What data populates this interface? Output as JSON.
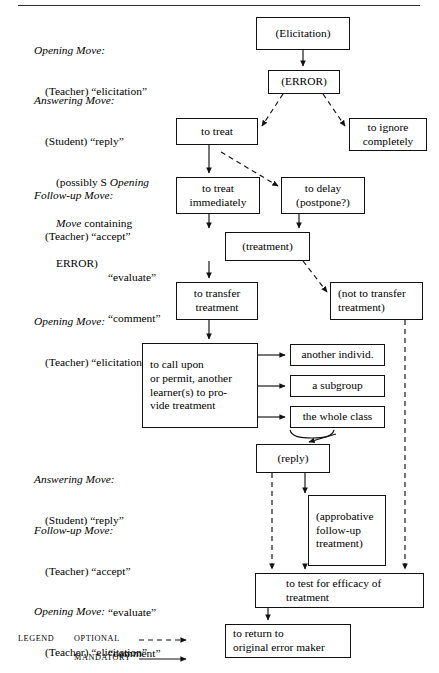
{
  "figure": {
    "title_rule": true,
    "type": "flowchart",
    "colors": {
      "ink": "#111111",
      "paper": "#ffffff",
      "rule": "#2b2b2b"
    }
  },
  "annotations": [
    {
      "id": "ann-opening-1",
      "heading": "Opening Move:",
      "lines": [
        "(Teacher) “elicitation”"
      ]
    },
    {
      "id": "ann-answering-1",
      "heading": "Answering Move:",
      "lines": [
        "(Student) “reply”",
        "(possibly S Opening",
        "Move containing",
        "ERROR)"
      ]
    },
    {
      "id": "ann-followup-1",
      "heading": "Follow-up Move:",
      "lines": [
        "(Teacher) “accept”",
        "“evaluate”",
        "“comment”"
      ]
    },
    {
      "id": "ann-opening-2",
      "heading": "Opening Move:",
      "lines": [
        "(Teacher) “elicitation”"
      ]
    },
    {
      "id": "ann-answering-2",
      "heading": "Answering Move:",
      "lines": [
        "(Student) “reply”"
      ]
    },
    {
      "id": "ann-followup-2",
      "heading": "Follow-up Move:",
      "lines": [
        "(Teacher) “accept”",
        "“evaluate”",
        "“comment”"
      ]
    },
    {
      "id": "ann-opening-3",
      "heading": "Opening Move:",
      "lines": [
        "(Teacher) “elicitation”"
      ]
    }
  ],
  "nodes": {
    "elicitation": {
      "label": "(Elicitation)"
    },
    "error": {
      "label": "(ERROR)"
    },
    "to_treat": {
      "label": "to treat"
    },
    "to_ignore": {
      "line1": "to ignore",
      "line2": "completely"
    },
    "treat_immediately": {
      "line1": "to treat",
      "line2": "immediately"
    },
    "to_delay": {
      "line1": "to delay",
      "line2": "(postpone?)"
    },
    "treatment": {
      "label": "(treatment)"
    },
    "transfer": {
      "line1": "to transfer",
      "line2": "treatment"
    },
    "not_transfer": {
      "line1": "(not to transfer",
      "line2": "treatment)"
    },
    "call_upon": {
      "line1": "to call upon",
      "line2": "or permit, another",
      "line3": "learner(s) to pro-",
      "line4": "vide treatment"
    },
    "another_individ": {
      "label": "another individ."
    },
    "a_subgroup": {
      "label": "a subgroup"
    },
    "whole_class": {
      "label": "the whole class"
    },
    "reply": {
      "label": "(reply)"
    },
    "approbative": {
      "line1": "(approbative",
      "line2": "follow-up",
      "line3": "treatment)"
    },
    "test_efficacy": {
      "line1": "to test for efficacy of",
      "line2": "treatment"
    },
    "return_maker": {
      "line1": "to return to",
      "line2": "original error maker"
    }
  },
  "legend": {
    "title": "LEGEND",
    "items": [
      {
        "label": "OPTIONAL",
        "style": "dashed-arrow"
      },
      {
        "label": "MANDATORY",
        "style": "solid-arrow"
      }
    ]
  },
  "edges": [
    {
      "from": "elicitation",
      "to": "error",
      "style": "mandatory"
    },
    {
      "from": "error",
      "to": "to_treat",
      "style": "optional"
    },
    {
      "from": "error",
      "to": "to_ignore",
      "style": "optional"
    },
    {
      "from": "to_treat",
      "to": "treat_immediately",
      "style": "mandatory"
    },
    {
      "from": "to_treat",
      "to": "to_delay",
      "style": "optional"
    },
    {
      "from": "treat_immediately",
      "to": "treatment",
      "style": "mandatory"
    },
    {
      "from": "to_delay",
      "to": "treatment",
      "style": "mandatory"
    },
    {
      "from": "treatment",
      "to": "transfer",
      "style": "mandatory"
    },
    {
      "from": "treatment",
      "to": "not_transfer",
      "style": "optional"
    },
    {
      "from": "transfer",
      "to": "call_upon",
      "style": "mandatory"
    },
    {
      "from": "call_upon",
      "to": "another_individ",
      "style": "mandatory"
    },
    {
      "from": "call_upon",
      "to": "a_subgroup",
      "style": "mandatory"
    },
    {
      "from": "call_upon",
      "to": "whole_class",
      "style": "mandatory"
    },
    {
      "from": "whole_class",
      "to": "reply",
      "style": "mandatory"
    },
    {
      "from": "reply",
      "to": "approbative",
      "style": "mandatory"
    },
    {
      "from": "reply",
      "to": "test_efficacy",
      "style": "optional"
    },
    {
      "from": "approbative",
      "to": "test_efficacy",
      "style": "mandatory"
    },
    {
      "from": "not_transfer",
      "to": "test_efficacy",
      "style": "optional"
    },
    {
      "from": "test_efficacy",
      "to": "return_maker",
      "style": "mandatory"
    }
  ]
}
